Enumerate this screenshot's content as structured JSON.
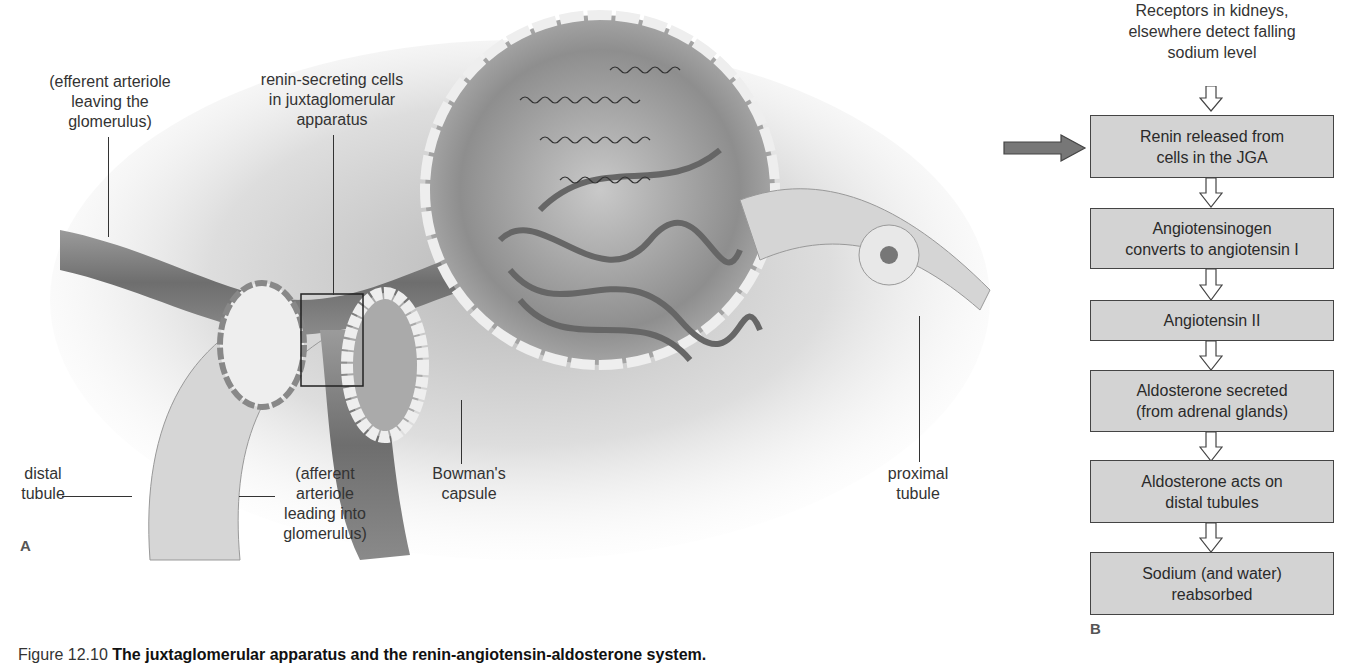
{
  "panel_a": {
    "letter": "A",
    "labels": {
      "efferent_arteriole": "(efferent arteriole\nleaving the\nglomerulus)",
      "renin_cells": "renin-secreting cells\nin juxtaglomerular\napparatus",
      "distal_tubule": "distal\ntubule",
      "afferent_arteriole": "(afferent arteriole\nleading into\nglomerulus)",
      "bowmans_capsule": "Bowman's\ncapsule",
      "proximal_tubule": "proximal\ntubule"
    }
  },
  "panel_b": {
    "letter": "B",
    "start_text": "Receptors in kidneys,\nelsewhere detect falling\nsodium level",
    "steps": [
      "Renin released from\ncells in the JGA",
      "Angiotensinogen\nconverts to angiotensin I",
      "Angiotensin II",
      "Aldosterone secreted\n(from adrenal glands)",
      "Aldosterone acts on\ndistal tubules",
      "Sodium (and water)\nreabsorbed"
    ],
    "colors": {
      "box_fill": "#d3d3d3",
      "box_border": "#444444",
      "pointer_arrow": "#777777"
    }
  },
  "caption": {
    "figure_number": "Figure 12.10",
    "title": "The juxtaglomerular apparatus and the renin-angiotensin-aldosterone system."
  }
}
